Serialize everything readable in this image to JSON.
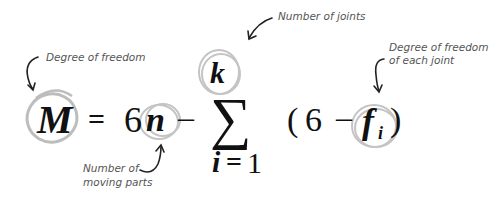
{
  "annotations": {
    "dof": "Degree of freedom",
    "joints": "Number of joints",
    "joint_dof_line1": "Degree of freedom",
    "joint_dof_line2": "of each joint",
    "moving_line1": "Number of",
    "moving_line2": "moving parts"
  },
  "equation": {
    "lhs": "M",
    "equals": "=",
    "coef": "6",
    "n": "n",
    "minus1": "–",
    "sigma": "∑",
    "upper": "k",
    "lower_var": "i",
    "lower_eq": "=",
    "lower_val": "1",
    "open_paren": "(",
    "six": "6",
    "minus2": "–",
    "f": "f",
    "sub_i": "i",
    "close_paren": ")"
  },
  "colors": {
    "circle": "#bdbdbd",
    "text": "#111111",
    "annotation": "#555555"
  }
}
